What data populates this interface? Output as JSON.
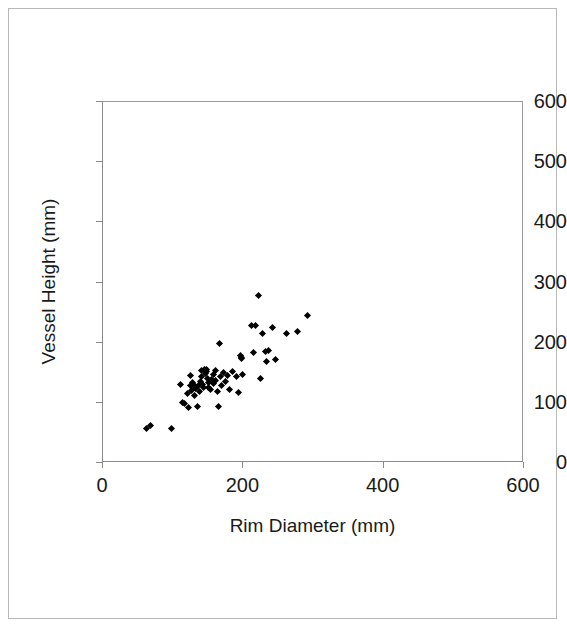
{
  "figure": {
    "background_color": "#ffffff",
    "frame_color": "#b8b8b8",
    "axis_color": "#8a8a8a",
    "marker_color": "#000000"
  },
  "chart_data": {
    "type": "scatter",
    "title": "",
    "xlabel": "Rim Diameter (mm)",
    "ylabel": "Vessel Height (mm)",
    "xlim": [
      0,
      600
    ],
    "ylim": [
      0,
      600
    ],
    "xticks": [
      0,
      200,
      400,
      600
    ],
    "yticks": [
      0,
      100,
      200,
      300,
      400,
      500,
      600
    ],
    "xtick_labels": [
      "0",
      "200",
      "400",
      "600"
    ],
    "ytick_labels": [
      "0",
      "100",
      "200",
      "300",
      "400",
      "500",
      "600"
    ],
    "grid": false,
    "legend": null,
    "marker": "diamond",
    "marker_size": 5,
    "n_points": 67,
    "series": [
      {
        "name": "Vessels",
        "points": [
          [
            62,
            58
          ],
          [
            68,
            63
          ],
          [
            97,
            57
          ],
          [
            111,
            130
          ],
          [
            113,
            101
          ],
          [
            116,
            99
          ],
          [
            120,
            115
          ],
          [
            122,
            93
          ],
          [
            124,
            146
          ],
          [
            125,
            128
          ],
          [
            126,
            121
          ],
          [
            127,
            134
          ],
          [
            129,
            131
          ],
          [
            130,
            112
          ],
          [
            131,
            127
          ],
          [
            132,
            124
          ],
          [
            134,
            94
          ],
          [
            136,
            129
          ],
          [
            137,
            119
          ],
          [
            139,
            136
          ],
          [
            140,
            153
          ],
          [
            141,
            143
          ],
          [
            142,
            131
          ],
          [
            143,
            125
          ],
          [
            145,
            156
          ],
          [
            146,
            148
          ],
          [
            147,
            155
          ],
          [
            148,
            152
          ],
          [
            149,
            141
          ],
          [
            150,
            126
          ],
          [
            151,
            133
          ],
          [
            153,
            122
          ],
          [
            155,
            139
          ],
          [
            157,
            147
          ],
          [
            158,
            132
          ],
          [
            160,
            154
          ],
          [
            161,
            137
          ],
          [
            163,
            119
          ],
          [
            164,
            94
          ],
          [
            166,
            199
          ],
          [
            167,
            144
          ],
          [
            169,
            128
          ],
          [
            172,
            150
          ],
          [
            175,
            135
          ],
          [
            177,
            146
          ],
          [
            180,
            123
          ],
          [
            185,
            152
          ],
          [
            190,
            144
          ],
          [
            193,
            118
          ],
          [
            196,
            178
          ],
          [
            197,
            173
          ],
          [
            198,
            176
          ],
          [
            199,
            147
          ],
          [
            212,
            229
          ],
          [
            215,
            184
          ],
          [
            218,
            228
          ],
          [
            221,
            279
          ],
          [
            224,
            140
          ],
          [
            228,
            216
          ],
          [
            231,
            186
          ],
          [
            233,
            169
          ],
          [
            236,
            187
          ],
          [
            241,
            225
          ],
          [
            246,
            172
          ],
          [
            261,
            216
          ],
          [
            277,
            218
          ],
          [
            291,
            245
          ]
        ]
      }
    ]
  }
}
